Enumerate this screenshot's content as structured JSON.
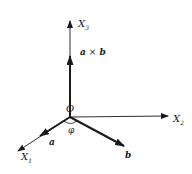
{
  "diagram": {
    "title": "",
    "axes": [
      {
        "id": "x1",
        "label": "X",
        "subscript": "1"
      },
      {
        "id": "x2",
        "label": "X",
        "subscript": "2"
      },
      {
        "id": "x3",
        "label": "X",
        "subscript": "3"
      }
    ],
    "origin_label": "O",
    "vectors": [
      {
        "id": "a",
        "label": "a"
      },
      {
        "id": "b",
        "label": "b"
      },
      {
        "id": "axb",
        "label_left": "a",
        "operator": "×",
        "label_right": "b"
      }
    ],
    "angle_label": "φ",
    "colors": {
      "ink": "#1a1a1a",
      "background": "#ffffff"
    }
  }
}
